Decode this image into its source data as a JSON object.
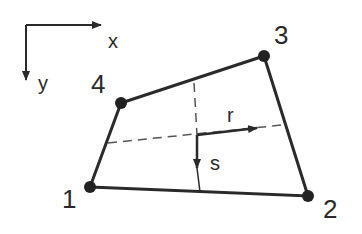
{
  "diagram": {
    "global_axes": {
      "x_label": "x",
      "y_label": "y"
    },
    "local_axes": {
      "r_label": "r",
      "s_label": "s"
    },
    "nodes": [
      {
        "id": "1",
        "label": "1"
      },
      {
        "id": "2",
        "label": "2"
      },
      {
        "id": "3",
        "label": "3"
      },
      {
        "id": "4",
        "label": "4"
      }
    ],
    "colors": {
      "stroke": "#2a2a2a",
      "dashed": "#555555",
      "background": "#ffffff"
    }
  }
}
